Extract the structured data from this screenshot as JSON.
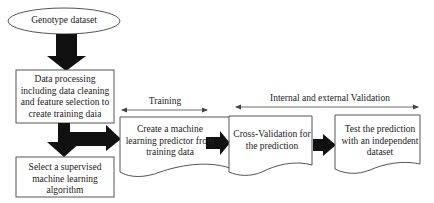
{
  "nodes": {
    "genotype": {
      "label": "Genotype dataset",
      "shape": "ellipse"
    },
    "processing": {
      "label": "Data processing including data cleaning and feature selection to create training daia",
      "shape": "rectangle"
    },
    "select": {
      "label": "Select a supervised machine learning algorithm",
      "shape": "rectangle"
    },
    "predictor": {
      "label": "Create a machine learning predictor from training data",
      "shape": "document"
    },
    "crossval": {
      "label": "Cross-Validation for the prediction",
      "shape": "document"
    },
    "test": {
      "label": "Test the prediction with an independent dataset",
      "shape": "document"
    }
  },
  "spans": {
    "training": {
      "label": "Training"
    },
    "validation": {
      "label": "Internal and external Validation"
    }
  },
  "edges": [
    {
      "from": "genotype",
      "to": "processing"
    },
    {
      "from": "processing",
      "to": "select"
    },
    {
      "from": "processing",
      "to": "predictor"
    },
    {
      "from": "predictor",
      "to": "crossval"
    },
    {
      "from": "crossval",
      "to": "test"
    }
  ],
  "colors": {
    "stroke": "#555555",
    "arrow": "#111111",
    "background": "#ffffff"
  }
}
